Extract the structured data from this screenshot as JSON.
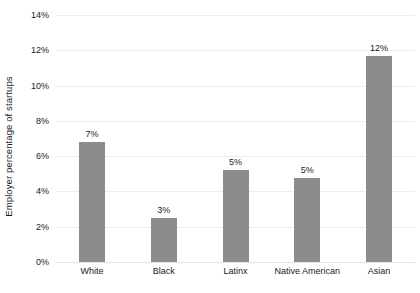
{
  "chart_data": {
    "type": "bar",
    "title": "",
    "xlabel": "",
    "ylabel": "Employer percentage of startups",
    "categories": [
      "White",
      "Black",
      "Latinx",
      "Native American",
      "Asian"
    ],
    "values": [
      6.8,
      2.5,
      5.2,
      4.75,
      11.7
    ],
    "value_labels": [
      "7%",
      "3%",
      "5%",
      "5%",
      "12%"
    ],
    "ylim": [
      0,
      14
    ],
    "ytick_values": [
      0,
      2,
      4,
      6,
      8,
      10,
      12,
      14
    ],
    "ytick_labels": [
      "0%",
      "2%",
      "4%",
      "6%",
      "8%",
      "10%",
      "12%",
      "14%"
    ],
    "grid": true,
    "legend": "none",
    "bar_color": "#8c8c8c",
    "grid_color": "#ededed",
    "background_color": "#ffffff",
    "text_color": "#1a1a1a"
  }
}
